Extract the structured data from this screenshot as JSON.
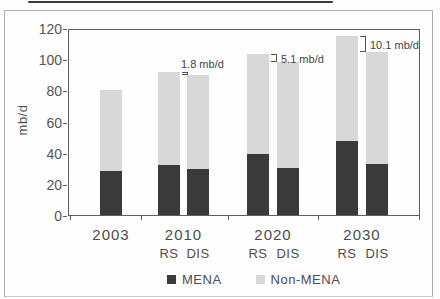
{
  "chart_data": {
    "type": "bar",
    "stacked": true,
    "title": "",
    "xlabel": "",
    "ylabel": "mb/d",
    "ylim": [
      0,
      120
    ],
    "yticks": [
      0,
      20,
      40,
      60,
      80,
      100,
      120
    ],
    "grid": false,
    "legend_position": "bottom",
    "series_names": [
      "MENA",
      "Non-MENA"
    ],
    "legend": [
      {
        "name": "MENA",
        "color": "#3a3a3a"
      },
      {
        "name": "Non-MENA",
        "color": "#d8d8d8"
      }
    ],
    "groups": [
      {
        "year": "2003",
        "bars": [
          {
            "label": "",
            "MENA": 29,
            "Non-MENA": 52,
            "total": 81
          }
        ]
      },
      {
        "year": "2010",
        "bars": [
          {
            "label": "RS",
            "MENA": 33,
            "Non-MENA": 59.5,
            "total": 92.5
          },
          {
            "label": "DIS",
            "MENA": 30,
            "Non-MENA": 60.7,
            "total": 90.7
          }
        ]
      },
      {
        "year": "2020",
        "bars": [
          {
            "label": "RS",
            "MENA": 40,
            "Non-MENA": 64.0,
            "total": 104.0
          },
          {
            "label": "DIS",
            "MENA": 31,
            "Non-MENA": 67.9,
            "total": 98.9
          }
        ]
      },
      {
        "year": "2030",
        "bars": [
          {
            "label": "RS",
            "MENA": 48,
            "Non-MENA": 67.4,
            "total": 115.4
          },
          {
            "label": "DIS",
            "MENA": 33.5,
            "Non-MENA": 71.8,
            "total": 105.3
          }
        ]
      }
    ],
    "annotations": [
      {
        "label": "1.8 mb/d",
        "year": "2010",
        "placement": "above"
      },
      {
        "label": "5.1 mb/d",
        "year": "2020",
        "placement": "right"
      },
      {
        "label": "10.1 mb/d",
        "year": "2030",
        "placement": "right"
      }
    ],
    "colors": {
      "MENA": "#3a3a3a",
      "Non-MENA": "#d8d8d8"
    }
  }
}
